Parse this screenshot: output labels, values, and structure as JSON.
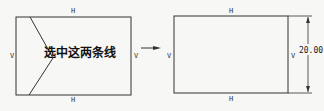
{
  "left_figure": {
    "annotation": "选中这两条线",
    "top_constraint": "H",
    "bottom_constraint": "H",
    "left_constraint": "V",
    "right_constraint": "V"
  },
  "arrow": {
    "direction": "right"
  },
  "right_figure": {
    "top_constraint": "H",
    "bottom_constraint": "H",
    "left_constraint": "V",
    "right_constraint": "V",
    "dimension_value": "20.00"
  },
  "colors": {
    "line": "#333333",
    "background": "#f7f7f5"
  }
}
